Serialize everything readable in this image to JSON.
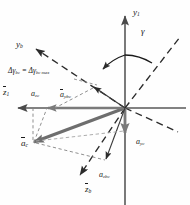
{
  "figure": {
    "background": "#fefefe",
    "colors": {
      "axis": "#585858",
      "main_vector": "#6e6e6e",
      "component_vector": "#7a7a7a",
      "dashed_construction": "#2b2b2b",
      "dashed_light": "#9a9a9a",
      "text": "#1a1a1a"
    },
    "origin": {
      "x": 125,
      "y": 108
    }
  },
  "axes": [
    {
      "id": "y1",
      "label": "y",
      "sub": "1",
      "x": 133,
      "y": 8,
      "desc": "vertical-axis-up"
    },
    {
      "id": "z1",
      "label": "z",
      "sub": "1",
      "x": 3,
      "y": 89,
      "desc": "horizontal-axis-left",
      "overbar": true
    },
    {
      "id": "yb",
      "label": "y",
      "sub": "b",
      "x": 16,
      "y": 40,
      "desc": "body-y-axis"
    },
    {
      "id": "zb",
      "label": "z",
      "sub": "b",
      "x": 85,
      "y": 186,
      "desc": "body-z-axis",
      "overbar": true
    }
  ],
  "angle": {
    "symbol": "γ",
    "x": 141,
    "y": 28,
    "desc": "gamma-angle-between-y1-and-dashed-line"
  },
  "vectors": [
    {
      "id": "a_c",
      "label": "a",
      "sub": "c",
      "x": 21,
      "y": 140,
      "overbar": true,
      "desc": "resultant-acceleration-vector"
    },
    {
      "id": "a_zc",
      "label": "a",
      "sub": "zc",
      "x": 31,
      "y": 91,
      "overbar": false,
      "desc": "z-component-of-ac"
    },
    {
      "id": "a_yc",
      "label": "a",
      "sub": "yc",
      "x": 136,
      "y": 139,
      "overbar": false,
      "desc": "y-component-of-ac"
    },
    {
      "id": "a_ybc",
      "label": "a",
      "sub": "ybc",
      "x": 60,
      "y": 92,
      "overbar": true,
      "desc": "body-y-component-of-ac"
    },
    {
      "id": "a_zbc",
      "label": "a",
      "sub": "zbc",
      "x": 99,
      "y": 172,
      "overbar": false,
      "desc": "body-z-component-of-ac"
    }
  ],
  "annotation": {
    "id": "delta_gamma",
    "text_parts": {
      "delta": "Δ",
      "gamma": "γ",
      "sub1": "bc",
      "equals": "=",
      "sub2": "bc max"
    },
    "full_text": "Δγbc = Δγbc max",
    "x": 8,
    "y": 67,
    "desc": "delta-gamma-bc-equals-delta-gamma-bc-max"
  }
}
